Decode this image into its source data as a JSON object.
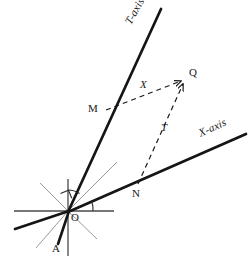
{
  "figure": {
    "background_color": "#ffffff",
    "stroke_color": "#1a1a1a",
    "thin_stroke_color": "#8c8c8c",
    "dashed_color": "#1a1a1a",
    "width": 250,
    "height": 266
  },
  "axes": [
    {
      "key": "t_axis",
      "label": "T-axis",
      "label_x": 133,
      "label_y": 22,
      "label_rotation": -61,
      "from": [
        68,
        211
      ],
      "to": [
        161,
        9
      ],
      "stroke_width": 2.6
    },
    {
      "key": "x_axis",
      "label": "X-axis",
      "label_x": 203,
      "label_y": 126,
      "label_rotation": -24,
      "from": [
        68,
        211
      ],
      "to": [
        246,
        134
      ],
      "stroke_width": 2.6
    }
  ],
  "points": [
    {
      "key": "origin",
      "label": "O",
      "x": 68,
      "y": 211,
      "label_x": 71,
      "label_y": 215
    },
    {
      "key": "m",
      "label": "M",
      "x": 104,
      "y": 110,
      "label_x": 89,
      "label_y": 103
    },
    {
      "key": "n",
      "label": "N",
      "x": 137,
      "y": 185,
      "label_x": 133,
      "label_y": 189
    },
    {
      "key": "q",
      "label": "Q",
      "x": 185,
      "y": 79,
      "label_x": 190,
      "label_y": 68
    },
    {
      "key": "a",
      "label": "A",
      "x": 57,
      "y": 240,
      "label_x": 52,
      "label_y": 240
    }
  ],
  "coordinate_segments": [
    {
      "key": "segment-mq",
      "label": "X",
      "label_x": 141,
      "label_y": 81,
      "from": [
        104,
        110
      ],
      "to": [
        185,
        79
      ],
      "style": "dashed-arrow"
    },
    {
      "key": "segment-nq",
      "label": "T",
      "label_x": 162,
      "label_y": 125,
      "from": [
        137,
        185
      ],
      "to": [
        185,
        79
      ],
      "style": "dashed-arrow"
    }
  ],
  "origin_rays": [
    {
      "key": "ray-horizontal-left",
      "weight": "thin",
      "from": [
        68,
        211
      ],
      "to": [
        14,
        211
      ]
    },
    {
      "key": "ray-horizontal-right",
      "weight": "thin",
      "from": [
        68,
        211
      ],
      "to": [
        114,
        211
      ]
    },
    {
      "key": "ray-vertical-up",
      "weight": "thin",
      "from": [
        68,
        211
      ],
      "to": [
        68,
        180
      ]
    },
    {
      "key": "ray-vertical-down",
      "weight": "thin",
      "from": [
        68,
        211
      ],
      "to": [
        68,
        255
      ]
    },
    {
      "key": "ray-diagonal-upleft",
      "weight": "thin",
      "from": [
        68,
        211
      ],
      "to": [
        40,
        184
      ]
    },
    {
      "key": "ray-diagonal-upright",
      "weight": "thin",
      "from": [
        68,
        211
      ],
      "to": [
        116,
        163
      ]
    },
    {
      "key": "ray-diagonal-downright",
      "weight": "thin",
      "from": [
        68,
        211
      ],
      "to": [
        96,
        238
      ]
    },
    {
      "key": "ray-diagonal-downleft",
      "weight": "thin",
      "from": [
        68,
        211
      ],
      "to": [
        37,
        247
      ]
    },
    {
      "key": "ray-thick-left",
      "weight": "thick",
      "from": [
        68,
        211
      ],
      "to": [
        16,
        228
      ]
    },
    {
      "key": "ray-thick-a",
      "weight": "thick",
      "from": [
        68,
        211
      ],
      "to": [
        58,
        243
      ]
    }
  ],
  "angle_marks": [
    {
      "key": "right-angle-marker",
      "type": "right-angle",
      "note": "square marker on vertical at origin"
    },
    {
      "key": "angle-arc-t",
      "type": "arc",
      "note": "arc between vertical and T-axis"
    },
    {
      "key": "angle-arc-x",
      "type": "arc",
      "note": "arc between horizontal and X-axis"
    }
  ]
}
